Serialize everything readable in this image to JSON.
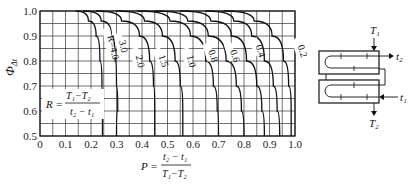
{
  "chart_data": {
    "type": "line",
    "title": "",
    "xlabel": "P = (t2 - t1) / (T1 - T2)",
    "ylabel": "Φ_Δt",
    "xlim": [
      0,
      1.0
    ],
    "ylim": [
      0.5,
      1.0
    ],
    "grid": true,
    "x_ticks": [
      "0",
      "0.1",
      "0.2",
      "0.3",
      "0.4",
      "0.5",
      "0.6",
      "0.7",
      "0.8",
      "0.9",
      "1.0"
    ],
    "y_ticks": [
      "0.5",
      "0.6",
      "0.7",
      "0.8",
      "0.9",
      "1.0"
    ],
    "legend_formula": "R = (T1 - T2) / (t2 - t1)",
    "series": [
      {
        "name": "R=4.0",
        "label": "R=4.0",
        "points": [
          [
            0.14,
            1.0
          ],
          [
            0.19,
            0.96
          ],
          [
            0.22,
            0.9
          ],
          [
            0.235,
            0.8
          ],
          [
            0.243,
            0.7
          ],
          [
            0.245,
            0.6
          ],
          [
            0.245,
            0.5
          ]
        ]
      },
      {
        "name": "R=3.0",
        "label": "3.0",
        "points": [
          [
            0.17,
            1.0
          ],
          [
            0.24,
            0.96
          ],
          [
            0.28,
            0.9
          ],
          [
            0.295,
            0.8
          ],
          [
            0.3,
            0.7
          ],
          [
            0.305,
            0.6
          ],
          [
            0.3,
            0.5
          ]
        ]
      },
      {
        "name": "R=2.0",
        "label": "2.0",
        "points": [
          [
            0.22,
            1.0
          ],
          [
            0.32,
            0.96
          ],
          [
            0.39,
            0.9
          ],
          [
            0.43,
            0.8
          ],
          [
            0.445,
            0.7
          ],
          [
            0.45,
            0.6
          ],
          [
            0.45,
            0.5
          ]
        ]
      },
      {
        "name": "R=1.5",
        "label": "1.5",
        "points": [
          [
            0.3,
            1.0
          ],
          [
            0.41,
            0.96
          ],
          [
            0.48,
            0.9
          ],
          [
            0.53,
            0.8
          ],
          [
            0.55,
            0.7
          ],
          [
            0.56,
            0.6
          ],
          [
            0.56,
            0.5
          ]
        ]
      },
      {
        "name": "R=1.0",
        "label": "1.0",
        "points": [
          [
            0.38,
            1.0
          ],
          [
            0.51,
            0.96
          ],
          [
            0.59,
            0.9
          ],
          [
            0.65,
            0.8
          ],
          [
            0.68,
            0.7
          ],
          [
            0.695,
            0.6
          ],
          [
            0.7,
            0.5
          ]
        ]
      },
      {
        "name": "R=0.8",
        "label": "0.8",
        "points": [
          [
            0.45,
            1.0
          ],
          [
            0.58,
            0.96
          ],
          [
            0.66,
            0.9
          ],
          [
            0.73,
            0.8
          ],
          [
            0.77,
            0.7
          ],
          [
            0.79,
            0.6
          ],
          [
            0.8,
            0.5
          ]
        ]
      },
      {
        "name": "R=0.6",
        "label": "0.6",
        "points": [
          [
            0.55,
            1.0
          ],
          [
            0.67,
            0.96
          ],
          [
            0.75,
            0.9
          ],
          [
            0.81,
            0.8
          ],
          [
            0.85,
            0.7
          ],
          [
            0.87,
            0.6
          ],
          [
            0.88,
            0.5
          ]
        ]
      },
      {
        "name": "R=0.4",
        "label": "0.4",
        "points": [
          [
            0.65,
            1.0
          ],
          [
            0.76,
            0.96
          ],
          [
            0.83,
            0.9
          ],
          [
            0.88,
            0.8
          ],
          [
            0.915,
            0.7
          ],
          [
            0.93,
            0.6
          ],
          [
            0.94,
            0.5
          ]
        ]
      },
      {
        "name": "R=0.2",
        "label": "0.2",
        "points": [
          [
            0.72,
            1.0
          ],
          [
            0.84,
            0.96
          ],
          [
            0.91,
            0.9
          ],
          [
            0.955,
            0.8
          ],
          [
            0.975,
            0.7
          ],
          [
            0.985,
            0.6
          ],
          [
            0.985,
            0.5
          ]
        ]
      }
    ]
  },
  "labels": {
    "y_axis_symbol": "Φ",
    "y_axis_subscript": "Δt",
    "R_formula_lhs": "R =",
    "R_formula_num": "T₁−T₂",
    "R_formula_den": "t₂ − t₁",
    "P_formula_lhs": "P =",
    "P_formula_num": "t₂ − t₁",
    "P_formula_den": "T₁−T₂"
  },
  "diagram": {
    "T1": "T₁",
    "T2": "T₂",
    "t1": "t₁",
    "t2": "t₂"
  }
}
